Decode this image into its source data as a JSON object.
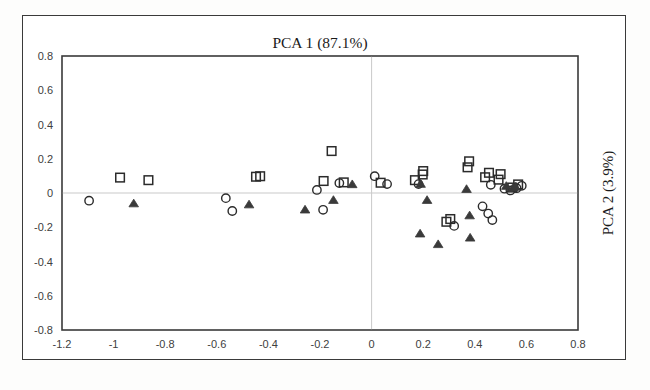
{
  "figure": {
    "title": "PCA 1 (87.1%)",
    "right_axis_title": "PCA 2 (3.9%)"
  },
  "chart_data": {
    "type": "scatter",
    "title": "PCA 1 (87.1%)",
    "xlabel": "",
    "ylabel": "PCA 2 (3.9%)",
    "ylabel_position": "right",
    "xlim": [
      -1.2,
      0.8
    ],
    "ylim": [
      -0.8,
      0.8
    ],
    "xticks": [
      -1.2,
      -1,
      -0.8,
      -0.6,
      -0.4,
      -0.2,
      0,
      0.2,
      0.4,
      0.6,
      0.8
    ],
    "xtick_labels": [
      "-1.2",
      "-1",
      "-0.8",
      "-0.6",
      "-0.4",
      "-0.2",
      "0",
      "0.2",
      "0.4",
      "0.6",
      "0.8"
    ],
    "yticks": [
      -0.8,
      -0.6,
      -0.4,
      -0.2,
      0,
      0.2,
      0.4,
      0.6,
      0.8
    ],
    "ytick_labels": [
      "-0.8",
      "-0.6",
      "-0.4",
      "-0.2",
      "0",
      "0.2",
      "0.4",
      "0.6",
      "0.8"
    ],
    "grid": false,
    "zero_lines": true,
    "legend": "none",
    "marker_colors": {
      "square": "#2b2b2b",
      "circle": "#2b2b2b",
      "triangle": "#3a3a3a"
    },
    "series": [
      {
        "name": "square",
        "marker": "square",
        "fill": "none",
        "points": [
          [
            -0.975,
            0.09
          ],
          [
            -0.865,
            0.075
          ],
          [
            -0.448,
            0.095
          ],
          [
            -0.432,
            0.098
          ],
          [
            -0.155,
            0.245
          ],
          [
            -0.186,
            0.07
          ],
          [
            -0.108,
            0.062
          ],
          [
            0.035,
            0.06
          ],
          [
            0.2,
            0.128
          ],
          [
            0.198,
            0.108
          ],
          [
            0.168,
            0.075
          ],
          [
            0.378,
            0.185
          ],
          [
            0.372,
            0.15
          ],
          [
            0.455,
            0.118
          ],
          [
            0.44,
            0.092
          ],
          [
            0.5,
            0.11
          ],
          [
            0.492,
            0.078
          ],
          [
            0.545,
            0.032
          ],
          [
            0.568,
            0.05
          ],
          [
            0.305,
            -0.152
          ],
          [
            0.29,
            -0.168
          ]
        ]
      },
      {
        "name": "circle",
        "marker": "circle",
        "fill": "none",
        "points": [
          [
            -1.095,
            -0.045
          ],
          [
            -0.565,
            -0.03
          ],
          [
            -0.54,
            -0.105
          ],
          [
            -0.212,
            0.018
          ],
          [
            -0.188,
            -0.098
          ],
          [
            -0.125,
            0.058
          ],
          [
            0.012,
            0.098
          ],
          [
            0.06,
            0.052
          ],
          [
            0.182,
            0.052
          ],
          [
            0.462,
            0.048
          ],
          [
            0.515,
            0.025
          ],
          [
            0.538,
            0.015
          ],
          [
            0.562,
            0.028
          ],
          [
            0.582,
            0.042
          ],
          [
            0.32,
            -0.192
          ],
          [
            0.452,
            -0.12
          ],
          [
            0.468,
            -0.158
          ],
          [
            0.43,
            -0.078
          ]
        ]
      },
      {
        "name": "triangle",
        "marker": "triangle",
        "fill": "solid",
        "points": [
          [
            -0.922,
            -0.062
          ],
          [
            -0.475,
            -0.068
          ],
          [
            -0.258,
            -0.098
          ],
          [
            -0.148,
            -0.042
          ],
          [
            -0.075,
            0.05
          ],
          [
            0.19,
            0.052
          ],
          [
            0.215,
            -0.042
          ],
          [
            0.188,
            -0.238
          ],
          [
            0.258,
            -0.3
          ],
          [
            0.368,
            0.022
          ],
          [
            0.38,
            -0.132
          ],
          [
            0.382,
            -0.262
          ],
          [
            0.522,
            0.04
          ],
          [
            0.548,
            0.03
          ],
          [
            0.558,
            0.035
          ]
        ]
      }
    ]
  }
}
